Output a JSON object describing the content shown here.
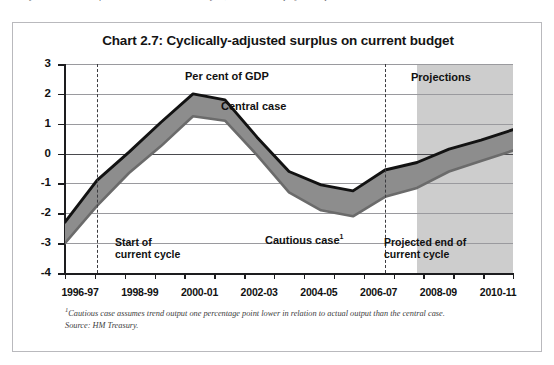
{
  "page": {
    "top_cut_text": "y the Government's fiscal rules over the economic cycle, in line with the projections period."
  },
  "figure": {
    "title": "Chart 2.7: Cyclically-adjusted surplus on current budget",
    "footnote_line1_marker": "1",
    "footnote_line1": "Cautious case assumes trend output one percentage point lower in relation to actual output than the central case.",
    "footnote_line2": "Source: HM Treasury."
  },
  "annotations": {
    "units": "Per cent of GDP",
    "central_case": "Central case",
    "cautious_case": "Cautious case",
    "cautious_case_footnote_marker": "1",
    "projections": "Projections",
    "start_of_cycle_line1": "Start of",
    "start_of_cycle_line2": "current cycle",
    "projected_end_line1": "Projected end of",
    "projected_end_line2": "current cycle"
  },
  "colors": {
    "central_line": "#121212",
    "cautious_line": "#6b6b6b",
    "fill_band": "#8d8d8d",
    "projection_band": "#c4c4c4",
    "gridline": "#9a9a9e",
    "axis": "#1d1d1f",
    "frame": "#b9b9bd"
  },
  "chart_data": {
    "type": "line",
    "title": "Chart 2.7: Cyclically-adjusted surplus on current budget",
    "xlabel": "",
    "ylabel": "Per cent of GDP",
    "ylim": [
      -4,
      3
    ],
    "yticks": [
      3,
      2,
      1,
      0,
      -1,
      -2,
      -3,
      -4
    ],
    "ytick_labels": [
      "3",
      "2",
      "1",
      "0",
      "-1",
      "-2",
      "-3",
      "-4"
    ],
    "grid": true,
    "legend": "inline-annotations",
    "x": [
      "1996-97",
      "1997-98",
      "1998-99",
      "1999-00",
      "2000-01",
      "2001-02",
      "2002-03",
      "2003-04",
      "2004-05",
      "2005-06",
      "2006-07",
      "2007-08",
      "2008-09",
      "2009-10",
      "2010-11"
    ],
    "xtick_labels": [
      "1996-97",
      "1998-99",
      "2000-01",
      "2002-03",
      "2004-05",
      "2006-07",
      "2008-09",
      "2010-11"
    ],
    "series": [
      {
        "name": "Central case",
        "color": "#121212",
        "values": [
          -2.3,
          -0.9,
          0.05,
          1.05,
          2.0,
          1.8,
          0.55,
          -0.6,
          -1.05,
          -1.25,
          -0.55,
          -0.3,
          0.15,
          0.45,
          0.8
        ]
      },
      {
        "name": "Cautious case",
        "color": "#6b6b6b",
        "values": [
          -3.0,
          -1.75,
          -0.65,
          0.25,
          1.25,
          1.1,
          -0.05,
          -1.3,
          -1.9,
          -2.1,
          -1.45,
          -1.15,
          -0.6,
          -0.25,
          0.1
        ]
      }
    ],
    "shaded_regions": [
      {
        "name": "Projections",
        "label": "Projections",
        "x_start": "2007-08",
        "x_end": "2010-11",
        "color": "#c4c4c4"
      }
    ],
    "vertical_markers": [
      {
        "name": "Start of current cycle",
        "x": "1997-98",
        "style": "dashed"
      },
      {
        "name": "Projected end of current cycle",
        "x": "2006-07",
        "style": "dashed"
      }
    ],
    "band_fill": {
      "between": [
        "Central case",
        "Cautious case"
      ],
      "color": "#8d8d8d",
      "note": "area between the two series is shaded grey"
    }
  }
}
